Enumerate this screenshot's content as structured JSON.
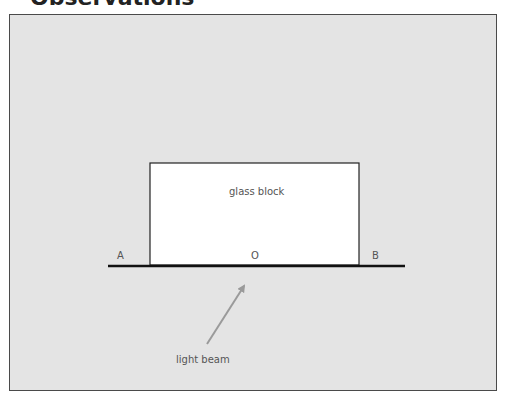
{
  "page": {
    "heading": "Observations"
  },
  "diagram": {
    "block_label": "glass block",
    "point_a": "A",
    "point_o": "O",
    "point_b": "B",
    "beam_label": "light beam",
    "colors": {
      "panel_bg": "#e4e4e4",
      "block_fill": "#ffffff",
      "line": "#111111",
      "beam": "#9a9a9a",
      "text": "#555555"
    }
  }
}
